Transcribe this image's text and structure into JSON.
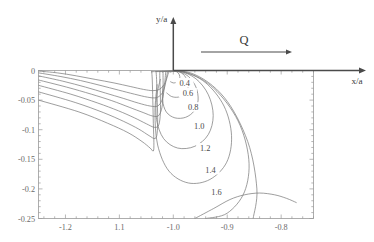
{
  "figure": {
    "background_color": "#ffffff",
    "line_color": "#7d7d7d",
    "axis_color": "#4a4a4a",
    "frame_color": "#9a9a9a"
  },
  "annotations": {
    "flux_label": "Q",
    "y_axis_name": "y/a",
    "x_axis_name": "x/a"
  },
  "chart_data": {
    "type": "line",
    "title": "",
    "subtitle": "",
    "xlabel": "x/a",
    "ylabel": "y/a",
    "xlim": [
      -1.25,
      -0.74
    ],
    "ylim": [
      -0.25,
      0.0
    ],
    "grid": false,
    "legend": "none",
    "x_ticks": [
      -1.2,
      -1.1,
      -1.0,
      -0.9,
      -0.8
    ],
    "x_tick_labels": [
      "-1.2",
      "1.1",
      "-1.0",
      "-0.9",
      "-0.8"
    ],
    "y_ticks": [
      0.0,
      -0.05,
      -0.1,
      -0.15,
      -0.2,
      -0.25
    ],
    "y_tick_labels": [
      "0",
      "-0.05",
      "-0.1",
      "-0.15",
      "-0.2",
      "-0.25"
    ],
    "minor_ticks_per_interval": 5,
    "contour_levels": [
      0.4,
      0.6,
      0.8,
      1.0,
      1.2,
      1.4,
      1.6
    ],
    "contour_label_texts": [
      "0.4",
      "0.6",
      "0.8",
      "1.0",
      "1.2",
      "1.4",
      "1.6"
    ],
    "singular_point": [
      -1.0,
      0.0
    ],
    "series": [
      {
        "name": "0.4",
        "level": 0.4,
        "label_position": [
          -0.979,
          -0.021
        ],
        "right_lobe": [
          [
            -1.006,
            -0.003
          ],
          [
            -0.998,
            -0.001
          ],
          [
            -0.991,
            -0.004
          ],
          [
            -0.988,
            -0.01
          ],
          [
            -0.989,
            -0.016
          ],
          [
            -0.994,
            -0.02
          ],
          [
            -1.0,
            -0.021
          ],
          [
            -1.005,
            -0.019
          ]
        ],
        "left_branch": [
          [
            -1.25,
            -0.001
          ],
          [
            -1.215,
            -0.004
          ],
          [
            -1.18,
            -0.009
          ],
          [
            -1.145,
            -0.015
          ],
          [
            -1.11,
            -0.021
          ],
          [
            -1.08,
            -0.027
          ],
          [
            -1.055,
            -0.032
          ],
          [
            -1.038,
            -0.034
          ],
          [
            -1.026,
            -0.032
          ],
          [
            -1.018,
            -0.025
          ],
          [
            -1.013,
            -0.016
          ],
          [
            -1.01,
            -0.007
          ],
          [
            -1.008,
            -0.001
          ]
        ]
      },
      {
        "name": "0.6",
        "level": 0.6,
        "label_position": [
          -0.973,
          -0.038
        ],
        "right_lobe": [
          [
            -1.01,
            -0.002
          ],
          [
            -0.996,
            -0.001
          ],
          [
            -0.982,
            -0.006
          ],
          [
            -0.974,
            -0.018
          ],
          [
            -0.973,
            -0.031
          ],
          [
            -0.979,
            -0.04
          ],
          [
            -0.991,
            -0.045
          ],
          [
            -1.003,
            -0.044
          ],
          [
            -1.012,
            -0.038
          ]
        ],
        "left_branch": [
          [
            -1.25,
            -0.004
          ],
          [
            -1.21,
            -0.01
          ],
          [
            -1.172,
            -0.017
          ],
          [
            -1.136,
            -0.025
          ],
          [
            -1.102,
            -0.033
          ],
          [
            -1.072,
            -0.04
          ],
          [
            -1.048,
            -0.045
          ],
          [
            -1.032,
            -0.046
          ],
          [
            -1.022,
            -0.04
          ],
          [
            -1.016,
            -0.028
          ],
          [
            -1.013,
            -0.014
          ],
          [
            -1.011,
            -0.003
          ]
        ]
      },
      {
        "name": "0.8",
        "level": 0.8,
        "label_position": [
          -0.963,
          -0.062
        ],
        "right_lobe": [
          [
            -1.014,
            -0.002
          ],
          [
            -0.993,
            -0.001
          ],
          [
            -0.972,
            -0.01
          ],
          [
            -0.958,
            -0.028
          ],
          [
            -0.954,
            -0.05
          ],
          [
            -0.961,
            -0.068
          ],
          [
            -0.977,
            -0.079
          ],
          [
            -0.997,
            -0.08
          ],
          [
            -1.013,
            -0.07
          ],
          [
            -1.02,
            -0.05
          ],
          [
            -1.019,
            -0.026
          ]
        ],
        "left_branch": [
          [
            -1.25,
            -0.009
          ],
          [
            -1.205,
            -0.018
          ],
          [
            -1.163,
            -0.028
          ],
          [
            -1.126,
            -0.038
          ],
          [
            -1.093,
            -0.047
          ],
          [
            -1.065,
            -0.055
          ],
          [
            -1.043,
            -0.06
          ],
          [
            -1.029,
            -0.06
          ],
          [
            -1.021,
            -0.05
          ],
          [
            -1.017,
            -0.032
          ],
          [
            -1.015,
            -0.012
          ],
          [
            -1.014,
            -0.002
          ]
        ]
      },
      {
        "name": "1.0",
        "level": 1.0,
        "label_position": [
          -0.952,
          -0.094
        ],
        "right_lobe": [
          [
            -1.019,
            -0.002
          ],
          [
            -0.989,
            -0.001
          ],
          [
            -0.958,
            -0.014
          ],
          [
            -0.935,
            -0.041
          ],
          [
            -0.926,
            -0.076
          ],
          [
            -0.935,
            -0.108
          ],
          [
            -0.96,
            -0.128
          ],
          [
            -0.992,
            -0.131
          ],
          [
            -1.018,
            -0.115
          ],
          [
            -1.031,
            -0.083
          ],
          [
            -1.031,
            -0.045
          ],
          [
            -1.024,
            -0.015
          ]
        ],
        "left_branch": [
          [
            -1.25,
            -0.016
          ],
          [
            -1.198,
            -0.028
          ],
          [
            -1.152,
            -0.04
          ],
          [
            -1.114,
            -0.051
          ],
          [
            -1.082,
            -0.062
          ],
          [
            -1.056,
            -0.071
          ],
          [
            -1.038,
            -0.077
          ],
          [
            -1.027,
            -0.076
          ],
          [
            -1.021,
            -0.062
          ],
          [
            -1.019,
            -0.038
          ],
          [
            -1.019,
            -0.012
          ],
          [
            -1.019,
            -0.002
          ]
        ]
      },
      {
        "name": "1.2",
        "level": 1.2,
        "label_position": [
          -0.941,
          -0.131
        ],
        "right_lobe": [
          [
            -1.025,
            -0.002
          ],
          [
            -0.984,
            -0.002
          ],
          [
            -0.941,
            -0.02
          ],
          [
            -0.906,
            -0.06
          ],
          [
            -0.892,
            -0.11
          ],
          [
            -0.901,
            -0.155
          ],
          [
            -0.932,
            -0.184
          ],
          [
            -0.972,
            -0.19
          ],
          [
            -1.008,
            -0.17
          ],
          [
            -1.029,
            -0.126
          ],
          [
            -1.034,
            -0.071
          ],
          [
            -1.03,
            -0.024
          ]
        ],
        "left_branch": [
          [
            -1.25,
            -0.025
          ],
          [
            -1.19,
            -0.04
          ],
          [
            -1.14,
            -0.055
          ],
          [
            -1.102,
            -0.068
          ],
          [
            -1.072,
            -0.08
          ],
          [
            -1.05,
            -0.09
          ],
          [
            -1.035,
            -0.096
          ],
          [
            -1.027,
            -0.092
          ],
          [
            -1.024,
            -0.072
          ],
          [
            -1.024,
            -0.042
          ],
          [
            -1.025,
            -0.013
          ],
          [
            -1.025,
            -0.002
          ]
        ]
      },
      {
        "name": "1.4",
        "level": 1.4,
        "label_position": [
          -0.931,
          -0.168
        ],
        "right_lobe": [
          [
            -1.032,
            -0.002
          ],
          [
            -0.977,
            -0.003
          ],
          [
            -0.925,
            -0.03
          ],
          [
            -0.88,
            -0.085
          ],
          [
            -0.86,
            -0.15
          ],
          [
            -0.868,
            -0.205
          ],
          [
            -0.9,
            -0.241
          ],
          [
            -0.94,
            -0.25
          ]
        ],
        "left_branch": [
          [
            -1.25,
            -0.036
          ],
          [
            -1.182,
            -0.054
          ],
          [
            -1.13,
            -0.071
          ],
          [
            -1.092,
            -0.086
          ],
          [
            -1.064,
            -0.099
          ],
          [
            -1.045,
            -0.11
          ],
          [
            -1.034,
            -0.115
          ],
          [
            -1.03,
            -0.106
          ],
          [
            -1.029,
            -0.08
          ],
          [
            -1.03,
            -0.046
          ],
          [
            -1.031,
            -0.015
          ],
          [
            -1.032,
            -0.002
          ]
        ]
      },
      {
        "name": "1.6",
        "level": 1.6,
        "label_position": [
          -0.92,
          -0.205
        ],
        "right_lobe": [
          [
            -1.04,
            -0.002
          ],
          [
            -0.968,
            -0.004
          ],
          [
            -0.906,
            -0.045
          ],
          [
            -0.862,
            -0.12
          ],
          [
            -0.845,
            -0.2
          ],
          [
            -0.852,
            -0.25
          ]
        ],
        "left_branch": [
          [
            -1.25,
            -0.05
          ],
          [
            -1.175,
            -0.07
          ],
          [
            -1.122,
            -0.089
          ],
          [
            -1.084,
            -0.105
          ],
          [
            -1.058,
            -0.12
          ],
          [
            -1.043,
            -0.131
          ],
          [
            -1.037,
            -0.136
          ],
          [
            -1.036,
            -0.122
          ],
          [
            -1.037,
            -0.09
          ],
          [
            -1.038,
            -0.05
          ],
          [
            -1.039,
            -0.016
          ],
          [
            -1.04,
            -0.002
          ]
        ]
      }
    ],
    "extra_curves": [
      {
        "name": "outer-arc-1",
        "points": [
          [
            -0.96,
            -0.25
          ],
          [
            -0.925,
            -0.233
          ],
          [
            -0.895,
            -0.218
          ],
          [
            -0.868,
            -0.21
          ],
          [
            -0.84,
            -0.207
          ],
          [
            -0.812,
            -0.21
          ],
          [
            -0.79,
            -0.216
          ],
          [
            -0.772,
            -0.223
          ]
        ]
      }
    ]
  }
}
